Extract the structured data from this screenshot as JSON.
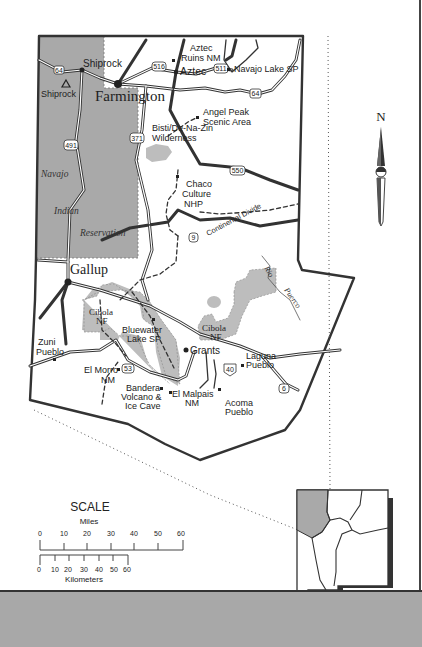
{
  "map": {
    "region": "Northwest New Mexico",
    "colors": {
      "reservation": "#a9a9a9",
      "forest": "#bdbdbd",
      "road": "#333333",
      "background": "#ffffff",
      "band": "#a8a8a8"
    },
    "cities": {
      "farmington": "Farmington",
      "gallup": "Gallup",
      "shiprock_town": "Shiprock",
      "aztec": "Aztec",
      "grants": "Grants"
    },
    "peaks": {
      "shiprock_peak": "Shiprock"
    },
    "sites": {
      "aztec_ruins_1": "Aztec",
      "aztec_ruins_2": "Ruins NM",
      "navajo_lake": "Navajo Lake SP",
      "angel_peak_1": "Angel Peak",
      "angel_peak_2": "Scenic Area",
      "bisti_1": "Bisti/De-Na-Zin",
      "bisti_2": "Wilderness",
      "chaco_1": "Chaco",
      "chaco_2": "Culture",
      "chaco_3": "NHP",
      "cibola_w_1": "Cibola",
      "cibola_w_2": "NF",
      "cibola_e_1": "Cibola",
      "cibola_e_2": "NF",
      "bluewater_1": "Bluewater",
      "bluewater_2": "Lake SP",
      "zuni_1": "Zuni",
      "zuni_2": "Pueblo",
      "el_morro_1": "El Morro",
      "el_morro_2": "NM",
      "bandera_1": "Bandera",
      "bandera_2": "Volcano &",
      "bandera_3": "Ice Cave",
      "el_malpais_1": "El Malpais",
      "el_malpais_2": "NM",
      "laguna_1": "Laguna",
      "laguna_2": "Pueblo",
      "acoma_1": "Acoma",
      "acoma_2": "Pueblo"
    },
    "regions": {
      "navajo": "Navajo",
      "indian": "Indian",
      "reservation": "Reservation"
    },
    "features": {
      "continental_divide": "Continental Divide",
      "rio": "Rio",
      "puerco": "Puerco"
    },
    "routes": {
      "r64_west": "64",
      "r64_east": "64",
      "r516": "516",
      "r511": "511",
      "r371": "371",
      "r491": "491",
      "r550": "550",
      "r9": "9",
      "r53": "53",
      "r40": "40",
      "r6": "6"
    }
  },
  "compass": {
    "label": "N"
  },
  "scale": {
    "title": "SCALE",
    "miles_label": "Miles",
    "miles_ticks": [
      "0",
      "10",
      "20",
      "30",
      "40",
      "50",
      "60"
    ],
    "km_label": "Kilometers",
    "km_ticks": [
      "0",
      "10",
      "20",
      "30",
      "40",
      "50",
      "60"
    ]
  },
  "locator": {
    "state": "New Mexico",
    "highlight": "northwest region"
  }
}
